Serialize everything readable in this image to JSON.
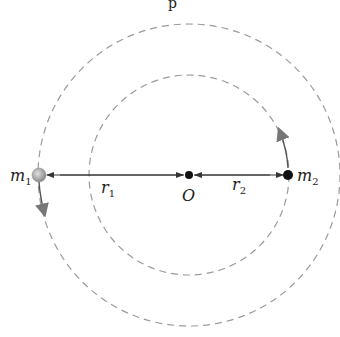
{
  "diagram": {
    "title_fragment": "p",
    "center": {
      "label": "O",
      "x": 189,
      "y": 175
    },
    "orbits": [
      {
        "name": "outer-orbit",
        "radius": 151,
        "color": "#9a9a9a"
      },
      {
        "name": "inner-orbit",
        "radius": 100,
        "color": "#9a9a9a"
      }
    ],
    "masses": [
      {
        "label": "m",
        "sub": "1",
        "x": 39,
        "y": 175,
        "color": "#a8a8a8",
        "velocity": "down"
      },
      {
        "label": "m",
        "sub": "2",
        "x": 288,
        "y": 175,
        "color": "#111111",
        "velocity": "up"
      }
    ],
    "distances": [
      {
        "label": "r",
        "sub": "1"
      },
      {
        "label": "r",
        "sub": "2"
      }
    ],
    "colors": {
      "line": "#333333",
      "arrow": "#777777",
      "dot": "#111111"
    }
  }
}
